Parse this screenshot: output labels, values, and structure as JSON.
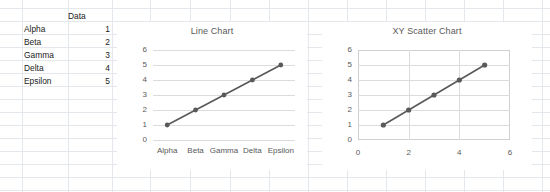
{
  "worksheet": {
    "header_label": "Data",
    "rows": [
      {
        "name": "Alpha",
        "value": "1"
      },
      {
        "name": "Beta",
        "value": "2"
      },
      {
        "name": "Gamma",
        "value": "3"
      },
      {
        "name": "Delta",
        "value": "4"
      },
      {
        "name": "Epsilon",
        "value": "5"
      }
    ]
  },
  "colors": {
    "series": "#595959",
    "grid": "#dcdcdc",
    "sheet_grid": "#e4e7ec",
    "text": "#595959"
  },
  "chart_data": [
    {
      "type": "line",
      "title": "Line Chart",
      "categories": [
        "Alpha",
        "Beta",
        "Gamma",
        "Delta",
        "Epsilon"
      ],
      "series": [
        {
          "name": "Data",
          "values": [
            1,
            2,
            3,
            4,
            5
          ]
        }
      ],
      "xlabel": "",
      "ylabel": "",
      "yticks": [
        6,
        5,
        4,
        3,
        2,
        1,
        0
      ],
      "ylim": [
        0,
        6
      ],
      "grid": "horizontal",
      "legend": "none",
      "markers": true
    },
    {
      "type": "scatter",
      "title": "XY Scatter Chart",
      "x": [
        1,
        2,
        3,
        4,
        5
      ],
      "series": [
        {
          "name": "Data",
          "values": [
            1,
            2,
            3,
            4,
            5
          ]
        }
      ],
      "xlabel": "",
      "ylabel": "",
      "xticks": [
        0,
        2,
        4,
        6
      ],
      "yticks": [
        6,
        5,
        4,
        3,
        2,
        1,
        0
      ],
      "xlim": [
        0,
        6
      ],
      "ylim": [
        0,
        6
      ],
      "grid": "both",
      "legend": "none",
      "markers": true
    }
  ]
}
